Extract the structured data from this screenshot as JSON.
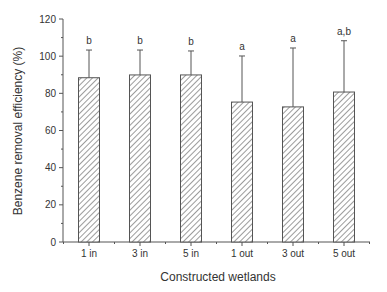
{
  "chart_data": {
    "type": "bar",
    "title": "",
    "xlabel": "Constructed wetlands",
    "ylabel": "Benzene removal efficiency  (%)",
    "ylim": [
      0,
      120
    ],
    "yticks": [
      0,
      20,
      40,
      60,
      80,
      100,
      120
    ],
    "yminor_step": 10,
    "grid": false,
    "legend": "none",
    "fill_pattern": "diagonal-hatch",
    "categories": [
      "1 in",
      "3 in",
      "5 in",
      "1 out",
      "3 out",
      "5 out"
    ],
    "values": [
      88.4,
      89.9,
      89.9,
      75.3,
      72.7,
      80.7
    ],
    "error_upper": [
      103.3,
      103.3,
      102.8,
      100.1,
      104.4,
      108.3
    ],
    "significance_labels": [
      "b",
      "b",
      "b",
      "a",
      "a",
      "a,b"
    ]
  }
}
